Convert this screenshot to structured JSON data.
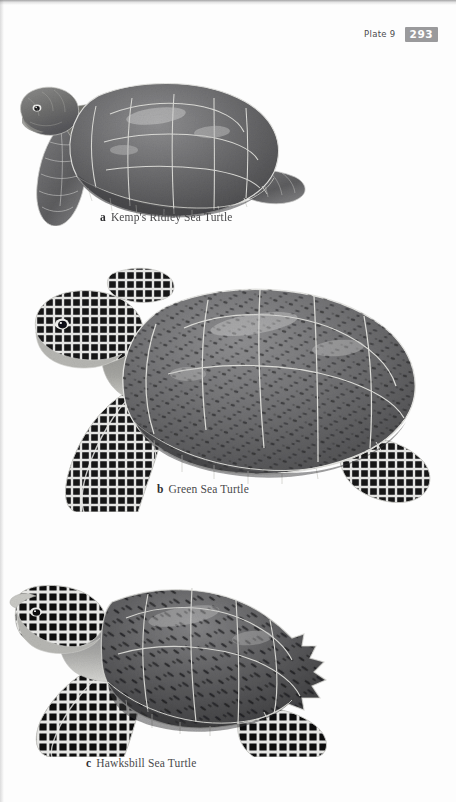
{
  "page": {
    "background_color": "#fdfdfd",
    "width": 456,
    "height": 802,
    "kind": "field-guide-plate"
  },
  "running_head": {
    "plate_label": "Plate 9",
    "folio": "293",
    "folio_box_color": "#9a9a9c",
    "folio_text_color": "#ffffff",
    "label_color": "#4b4b4d"
  },
  "figures": [
    {
      "key": "a",
      "caption": "Kemp's Ridley Sea Turtle",
      "name": "kemps-ridley-sea-turtle",
      "description": "Grayscale illustration of a Kemp's Ridley Sea Turtle in left profile, broad nearly round carapace with large scutes, head at upper left, front flipper extending down-left, rear flipper to the right",
      "orientation": "facing-left",
      "carapace_tone": "#6e6e70",
      "outline_tone": "#d8d8d6"
    },
    {
      "key": "b",
      "caption": "Green Sea Turtle",
      "name": "green-sea-turtle",
      "description": "Grayscale illustration of a Green Sea Turtle in left profile, large oval carapace with mottled dark speckled scutes, strongly reticulated black and white head and flipper scales, front flipper sweeping down-left, rear flipper at lower right",
      "orientation": "facing-left",
      "carapace_tone": "#737375",
      "outline_tone": "#dedede"
    },
    {
      "key": "c",
      "caption": "Hawksbill Sea Turtle",
      "name": "hawksbill-sea-turtle",
      "description": "Grayscale illustration of a Hawksbill Sea Turtle in left profile, narrow pointed beak, overlapping carapace scutes with dark streaked mottling and a serrated posterior carapace margin, reticulated flippers",
      "orientation": "facing-left",
      "carapace_tone": "#5f5f61",
      "outline_tone": "#dcdcda"
    }
  ],
  "captions": {
    "a_key": "a",
    "a_text": "Kemp's Ridley Sea Turtle",
    "b_key": "b",
    "b_text": "Green Sea Turtle",
    "c_key": "c",
    "c_text": "Hawksbill Sea Turtle"
  }
}
